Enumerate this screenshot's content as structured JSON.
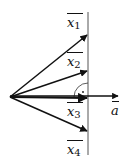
{
  "diagram": {
    "type": "vector-projection",
    "origin": [
      10,
      97
    ],
    "line_x": 88,
    "line_y_range": [
      12,
      155
    ],
    "vectors": [
      {
        "name": "x",
        "sub": "1",
        "tip": [
          88,
          34
        ],
        "label_pos": [
          67,
          12
        ]
      },
      {
        "name": "x",
        "sub": "2",
        "tip": [
          88,
          71
        ],
        "label_pos": [
          67,
          52
        ]
      },
      {
        "name": "x",
        "sub": "3",
        "tip": [
          88,
          98
        ],
        "label_pos": [
          67,
          104
        ]
      },
      {
        "name": "x",
        "sub": "4",
        "tip": [
          88,
          132
        ],
        "label_pos": [
          67,
          142
        ]
      }
    ],
    "a_vector": {
      "name": "a",
      "tip": [
        118,
        97
      ],
      "label_pos": [
        111,
        103
      ]
    },
    "right_angle_marker": "·",
    "stroke_color": "#111111",
    "line_color": "#555555"
  },
  "labels": {
    "x1": {
      "base": "x",
      "sub": "1"
    },
    "x2": {
      "base": "x",
      "sub": "2"
    },
    "x3": {
      "base": "x",
      "sub": "3"
    },
    "x4": {
      "base": "x",
      "sub": "4"
    },
    "a": {
      "base": "a"
    }
  }
}
